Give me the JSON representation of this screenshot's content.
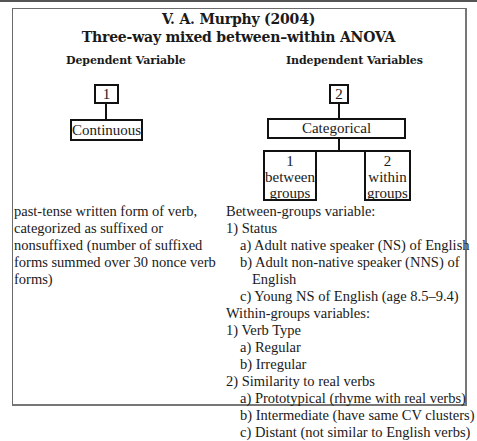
{
  "header": {
    "title": "V. A. Murphy (2004)",
    "subtitle": "Three-way mixed between–within ANOVA"
  },
  "dependent": {
    "heading": "Dependent Variable",
    "number": "1",
    "type": "Continuous",
    "description": "past-tense written form of verb, categorized as suffixed or nonsuffixed (number of suffixed forms summed over 30 nonce verb forms)"
  },
  "independent": {
    "heading": "Independent Variables",
    "number": "2",
    "type": "Categorical",
    "groups": [
      {
        "number": "1",
        "line1": "between",
        "line2": "groups"
      },
      {
        "number": "2",
        "line1": "within",
        "line2": "groups"
      }
    ],
    "lines": [
      "Between-groups variable:",
      "1) Status",
      "a) Adult native speaker (NS) of English",
      "b) Adult non-native speaker (NNS) of",
      "English",
      "c) Young NS of English (age 8.5–9.4)",
      "Within-groups variables:",
      "1) Verb Type",
      "a) Regular",
      "b) Irregular",
      "2) Similarity to real verbs",
      "a) Prototypical (rhyme with real verbs)",
      "b) Intermediate (have same CV clusters)",
      "c) Distant (not similar to English verbs)"
    ]
  }
}
